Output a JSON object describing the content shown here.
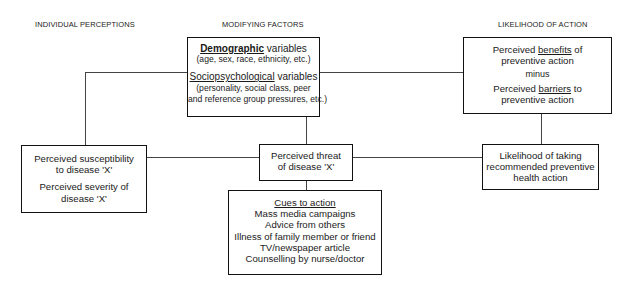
{
  "diagram": {
    "column_titles": {
      "left": "INDIVIDUAL PERCEPTIONS",
      "middle": "MODIFYING FACTORS",
      "right": "LIKELIHOOD OF ACTION"
    },
    "modifying_factors_box": {
      "demographic_heading_underlined": "Demographic",
      "demographic_heading_rest": " variables",
      "demographic_detail": "(age, sex, race, ethnicity, etc.)",
      "socio_heading_underlined": "Sociopsychological",
      "socio_heading_rest": " variables",
      "socio_detail_line1": "(personality, social class, peer",
      "socio_detail_line2": "and reference group pressures, etc.)"
    },
    "benefits_barriers_box": {
      "line1_prefix": "Perceived ",
      "line1_underlined": "benefits",
      "line1_suffix": " of",
      "line2": "preventive action",
      "minus": "minus",
      "line3_prefix": "Perceived ",
      "line3_underlined": "barriers",
      "line3_suffix": " to",
      "line4": "preventive action"
    },
    "individual_perceptions_box": {
      "line1": "Perceived susceptibility",
      "line2": "to disease 'X'",
      "line3": "Perceived severity of",
      "line4": "disease 'X'"
    },
    "threat_box": {
      "line1": "Perceived threat",
      "line2": "of disease 'X'"
    },
    "likelihood_box": {
      "line1": "Likelihood of taking",
      "line2": "recommended preventive",
      "line3": "health action"
    },
    "cues_box": {
      "heading": "Cues to action",
      "items": [
        "Mass media campaigns",
        "Advice from others",
        "Illness of family member or friend",
        "TV/newspaper article",
        "Counselling by nurse/doctor"
      ]
    }
  }
}
